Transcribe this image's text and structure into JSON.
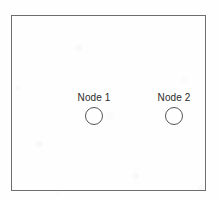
{
  "diagram": {
    "frame": {
      "name": "diagram-frame",
      "border_color": "#6e6e6e",
      "fill_color": "#ffffff"
    },
    "background_color": "#fefefe",
    "nodes": [
      {
        "id": "node-1",
        "label": "Node 1",
        "shape": "circle",
        "stroke_color": "#555555",
        "fill_color": "none",
        "label_color": "#2b2b2b"
      },
      {
        "id": "node-2",
        "label": "Node 2",
        "shape": "circle",
        "stroke_color": "#555555",
        "fill_color": "none",
        "label_color": "#2b2b2b"
      }
    ]
  }
}
